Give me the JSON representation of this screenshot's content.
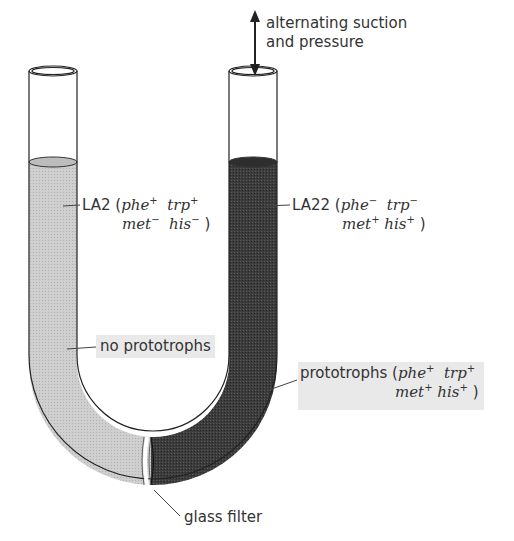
{
  "figure": {
    "arrow_label": {
      "line1": "alternating suction",
      "line2": "and pressure"
    },
    "left_arm": {
      "strain": "LA2",
      "genotype": [
        {
          "gene": "phe",
          "sign": "+"
        },
        {
          "gene": "trp",
          "sign": "+"
        },
        {
          "gene": "met",
          "sign": "−"
        },
        {
          "gene": "his",
          "sign": "−"
        }
      ],
      "result": "no prototrophs",
      "fill_color": "#c8c8c8"
    },
    "right_arm": {
      "strain": "LA22",
      "genotype": [
        {
          "gene": "phe",
          "sign": "−"
        },
        {
          "gene": "trp",
          "sign": "−"
        },
        {
          "gene": "met",
          "sign": "+"
        },
        {
          "gene": "his",
          "sign": "+"
        }
      ],
      "result": "prototrophs",
      "result_genotype": [
        {
          "gene": "phe",
          "sign": "+"
        },
        {
          "gene": "trp",
          "sign": "+"
        },
        {
          "gene": "met",
          "sign": "+"
        },
        {
          "gene": "his",
          "sign": "+"
        }
      ],
      "fill_color": "#3a3a3a"
    },
    "filter_label": "glass filter"
  }
}
